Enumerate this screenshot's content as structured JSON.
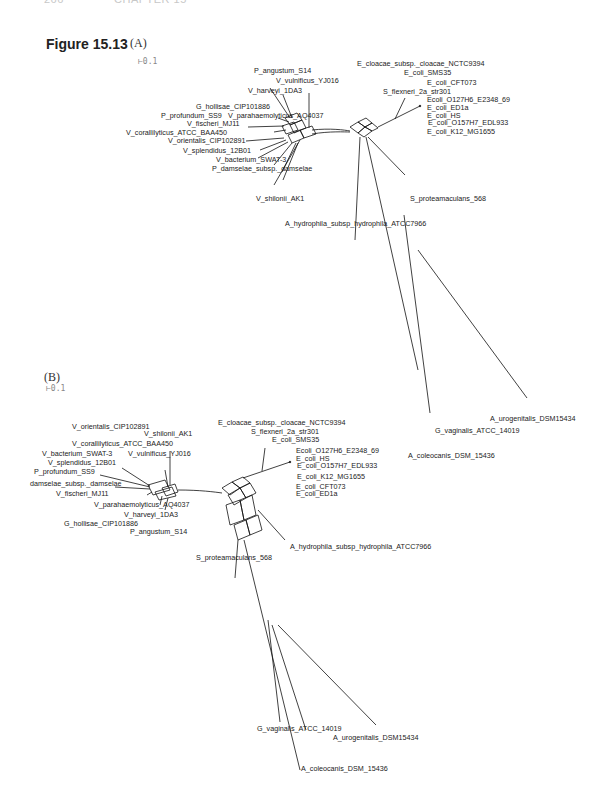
{
  "page": {
    "header_left": "266",
    "header_right": "CHAPTER 15"
  },
  "figure": {
    "label": "Figure 15.13",
    "panels": [
      {
        "id": "A",
        "label": "(A)",
        "scale_bar": "0.1",
        "taxa": [
          "P_angustum_S14",
          "V_vulnificus_YJ016",
          "V_harveyi_1DA3",
          "G_hollisae_CIP101886",
          "P_profundum_SS9",
          "V_parahaemolyticus_AQ4037",
          "V_fischeri_MJ11",
          "V_corallilyticus_ATCC_BAA450",
          "V_orientalis_CIP102891",
          "V_splendidus_12B01",
          "V_bacterium_SWAT-3",
          "P_damselae_subsp._damselae",
          "V_shilonii_AK1",
          "E_cloacae_subsp._cloacae_NCTC9394",
          "E_coli_SMS35",
          "E_coli_CFT073",
          "S_flexneri_2a_str301",
          "Ecoli_O127H6_E2348_69",
          "E_coli_ED1a",
          "E_coli_HS",
          "E_coli_O157H7_EDL933",
          "E_coli_K12_MG1655",
          "S_proteamaculans_568",
          "A_hydrophila_subsp_hydrophila_ATCC7966",
          "A_urogenitalis_DSM15434",
          "G_vaginalis_ATCC_14019",
          "A_coleocanis_DSM_15436"
        ]
      },
      {
        "id": "B",
        "label": "(B)",
        "scale_bar": "0.1",
        "taxa": [
          "V_orientalis_CIP102891",
          "V_shilonii_AK1",
          "V_corallilyticus_ATCC_BAA450",
          "V_bacterium_SWAT-3",
          "V_vulnificus_YJ016",
          "V_splendidus_12B01",
          "P_profundum_SS9",
          "damselae_subsp._damselae",
          "V_fischeri_MJ11",
          "V_parahaemolyticus_AQ4037",
          "V_harveyi_1DA3",
          "G_hollisae_CIP101886",
          "P_angustum_S14",
          "E_cloacae_subsp._cloacae_NCTC9394",
          "S_flexneri_2a_str301",
          "E_coli_SMS35",
          "Ecoli_O127H6_E2348_69",
          "E_coli_HS",
          "E_coli_O157H7_EDL933",
          "E_coli_K12_MG1655",
          "E_coli_CFT073",
          "E_coli_ED1a",
          "A_hydrophila_subsp_hydrophila_ATCC7966",
          "S_proteamaculans_568",
          "G_vaginalis_ATCC_14019",
          "A_urogenitalis_DSM15434",
          "A_coleocanis_DSM_15436"
        ]
      }
    ]
  }
}
